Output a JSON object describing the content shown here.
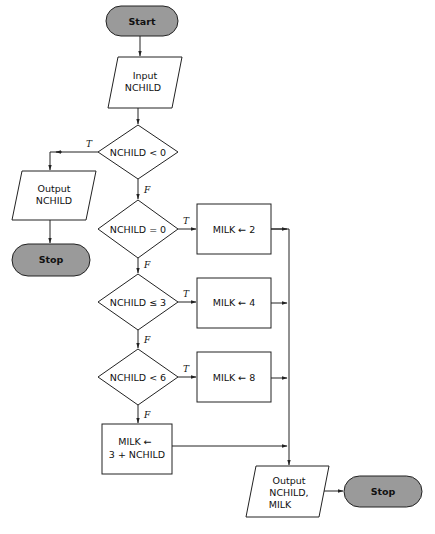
{
  "flowchart": {
    "start": {
      "label": "Start"
    },
    "input": {
      "line1": "Input",
      "line2": "NCHILD"
    },
    "decisions": [
      {
        "id": "d1",
        "label": "NCHILD < 0"
      },
      {
        "id": "d2",
        "label": "NCHILD = 0"
      },
      {
        "id": "d3",
        "label": "NCHILD ≤ 3"
      },
      {
        "id": "d4",
        "label": "NCHILD < 6"
      }
    ],
    "error_output": {
      "line1": "Output",
      "line2": "NCHILD"
    },
    "error_stop": {
      "label": "Stop"
    },
    "assignments": [
      {
        "id": "a1",
        "label": "MILK ← 2"
      },
      {
        "id": "a2",
        "label": "MILK ← 4"
      },
      {
        "id": "a3",
        "label": "MILK ← 8"
      },
      {
        "id": "a4",
        "line1": "MILK ←",
        "line2": "3 + NCHILD"
      }
    ],
    "final_output": {
      "line1": "Output",
      "line2": "NCHILD,",
      "line3": "MILK"
    },
    "final_stop": {
      "label": "Stop"
    },
    "branch_labels": {
      "true": "T",
      "false": "F"
    },
    "colors": {
      "terminal_fill": "#9a9a9a",
      "stroke": "#222222",
      "background": "#ffffff"
    }
  }
}
